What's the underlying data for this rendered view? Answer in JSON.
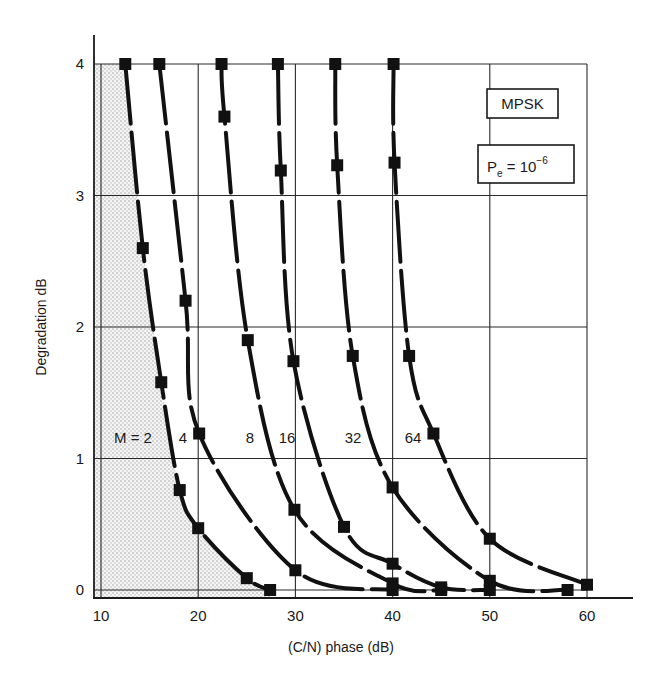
{
  "chart_data": {
    "type": "line",
    "title": "",
    "xlabel": "(C/N) phase (dB)",
    "ylabel": "Degradation dB",
    "xlim": [
      10,
      60
    ],
    "ylim": [
      0,
      4
    ],
    "x_ticks": [
      10,
      20,
      30,
      40,
      50,
      60
    ],
    "y_ticks": [
      0,
      1,
      2,
      3,
      4
    ],
    "grid": true,
    "legend": [
      {
        "text": "MPSK"
      },
      {
        "text_main": "P",
        "text_sub": "e",
        "text_eq": " = 10",
        "text_sup": "−6"
      }
    ],
    "shaded_region": "area under M = 2 curve",
    "series": [
      {
        "name": "M = 2",
        "label": "M = 2",
        "points": [
          [
            12.5,
            4.0
          ],
          [
            14.3,
            2.6
          ],
          [
            16.2,
            1.58
          ],
          [
            18.1,
            0.76
          ],
          [
            20.0,
            0.47
          ],
          [
            25.0,
            0.09
          ],
          [
            27.4,
            0.0
          ]
        ]
      },
      {
        "name": "M = 4",
        "label": "4",
        "points": [
          [
            16.0,
            4.0
          ],
          [
            18.7,
            2.2
          ],
          [
            20.1,
            1.19
          ],
          [
            30.0,
            0.15
          ],
          [
            40.0,
            0.0
          ]
        ]
      },
      {
        "name": "M = 8",
        "label": "8",
        "points": [
          [
            22.4,
            4.0
          ],
          [
            22.7,
            3.6
          ],
          [
            25.1,
            1.9
          ],
          [
            29.9,
            0.61
          ],
          [
            40.0,
            0.05
          ],
          [
            45.0,
            0.0
          ]
        ]
      },
      {
        "name": "M = 16",
        "label": "16",
        "points": [
          [
            28.2,
            4.0
          ],
          [
            28.5,
            3.19
          ],
          [
            29.8,
            1.74
          ],
          [
            35.0,
            0.48
          ],
          [
            40.0,
            0.2
          ],
          [
            45.0,
            0.02
          ],
          [
            50.0,
            0.0
          ]
        ]
      },
      {
        "name": "M = 32",
        "label": "32",
        "points": [
          [
            34.1,
            4.0
          ],
          [
            34.3,
            3.23
          ],
          [
            35.9,
            1.78
          ],
          [
            40.0,
            0.78
          ],
          [
            50.0,
            0.07
          ],
          [
            58.0,
            0.0
          ]
        ]
      },
      {
        "name": "M = 64",
        "label": "64",
        "points": [
          [
            40.1,
            4.0
          ],
          [
            40.2,
            3.25
          ],
          [
            41.7,
            1.78
          ],
          [
            44.2,
            1.19
          ],
          [
            50.0,
            0.39
          ],
          [
            60.0,
            0.04
          ]
        ]
      }
    ],
    "curve_label_positions": [
      {
        "label": "M = 2",
        "x": 133,
        "y": 443
      },
      {
        "label": "4",
        "x": 183,
        "y": 443
      },
      {
        "label": "8",
        "x": 250,
        "y": 443
      },
      {
        "label": "16",
        "x": 287,
        "y": 443
      },
      {
        "label": "32",
        "x": 353,
        "y": 443
      },
      {
        "label": "64",
        "x": 413,
        "y": 443
      }
    ]
  }
}
